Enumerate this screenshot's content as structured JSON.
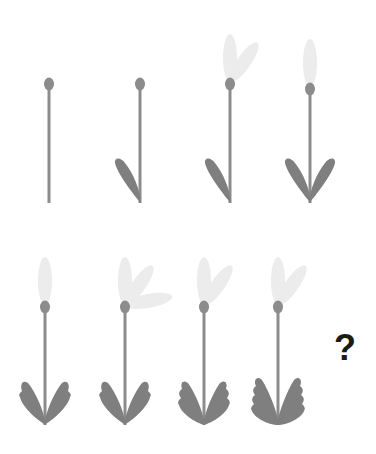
{
  "puzzle": {
    "title": "",
    "question_mark": "?",
    "colors": {
      "background": "#ffffff",
      "stem": "#8c8c8c",
      "bud": "#8c8c8c",
      "leaf": "#7f7f7f",
      "petal": "#ececec",
      "question": "#1a1a1a"
    },
    "figures": [
      {
        "id": 1,
        "row": 1,
        "x": 49,
        "bud_y": 84,
        "stem_bottom": 203,
        "leaves": 0,
        "leaf_style": "plain",
        "petals": []
      },
      {
        "id": 2,
        "row": 1,
        "x": 140,
        "bud_y": 84,
        "stem_bottom": 203,
        "leaves": 1,
        "leaf_style": "plain",
        "petals": []
      },
      {
        "id": 3,
        "row": 1,
        "x": 230,
        "bud_y": 84,
        "stem_bottom": 203,
        "leaves": 1,
        "leaf_style": "plain",
        "petals": [
          "up",
          "upright"
        ]
      },
      {
        "id": 4,
        "row": 1,
        "x": 310,
        "bud_y": 89,
        "stem_bottom": 203,
        "leaves": 2,
        "leaf_style": "plain",
        "petals": [
          "up"
        ]
      },
      {
        "id": 5,
        "row": 2,
        "x": 45,
        "bud_y": 307,
        "stem_bottom": 425,
        "leaves": 2,
        "leaf_style": "notch1",
        "petals": [
          "up"
        ]
      },
      {
        "id": 6,
        "row": 2,
        "x": 125,
        "bud_y": 307,
        "stem_bottom": 425,
        "leaves": 2,
        "leaf_style": "notch1",
        "petals": [
          "up",
          "upright",
          "right"
        ]
      },
      {
        "id": 7,
        "row": 2,
        "x": 204,
        "bud_y": 307,
        "stem_bottom": 425,
        "leaves": 2,
        "leaf_style": "notch2",
        "petals": [
          "up",
          "upright"
        ]
      },
      {
        "id": 8,
        "row": 2,
        "x": 278,
        "bud_y": 307,
        "stem_bottom": 425,
        "leaves": 2,
        "leaf_style": "notch3",
        "petals": [
          "up",
          "upright"
        ]
      }
    ]
  }
}
